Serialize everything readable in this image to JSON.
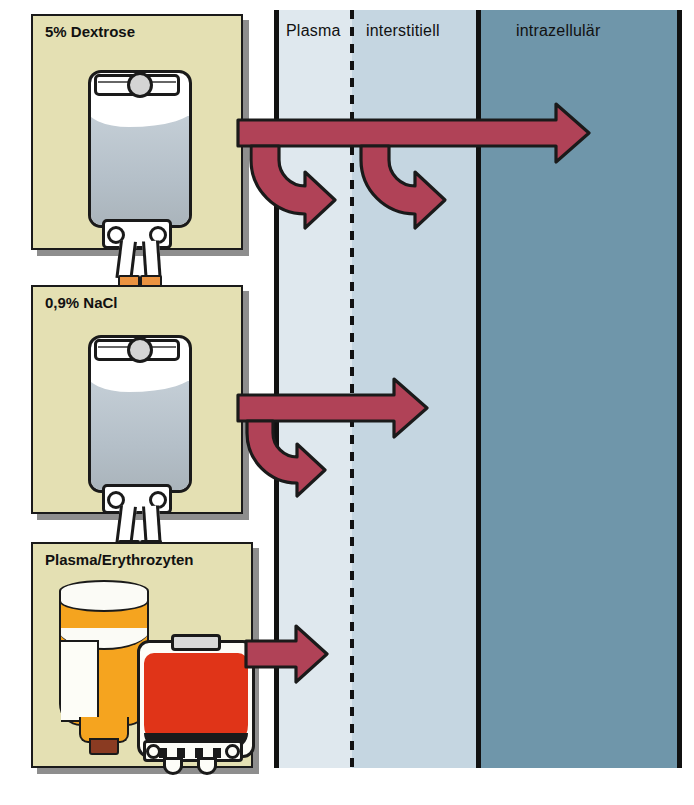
{
  "diagram": {
    "title_alt": "Verteilung von Infusionsloesungen in den Fluessigkeitskompartimenten",
    "compartments": [
      {
        "key": "plasma",
        "label": "Plasma",
        "color": "#dfe8ee"
      },
      {
        "key": "inter",
        "label": "interstitiell",
        "color": "#c5d6e1"
      },
      {
        "key": "intra",
        "label": "intrazellulär",
        "color": "#6f96aa"
      }
    ],
    "panels": [
      {
        "key": "dextrose",
        "title": "5% Dextrose",
        "container": "iv-bag"
      },
      {
        "key": "nacl",
        "title": "0,9% NaCl",
        "container": "iv-bag"
      },
      {
        "key": "blood",
        "title": "Plasma/Erythrozyten",
        "container": "bottle-and-blood-bag"
      }
    ],
    "flows": [
      {
        "from": "5% Dextrose",
        "reaches": [
          "Plasma",
          "interstitiell",
          "intrazellulär"
        ],
        "branches": 2
      },
      {
        "from": "0,9% NaCl",
        "reaches": [
          "Plasma",
          "interstitiell"
        ],
        "branches": 1
      },
      {
        "from": "Plasma/Erythrozyten",
        "reaches": [
          "Plasma"
        ],
        "branches": 0
      }
    ],
    "colors": {
      "panel_bg": "#e4e0b3",
      "panel_border": "#1a1a1a",
      "panel_shadow": "#8e8e8e",
      "arrow_fill": "#b04257",
      "arrow_stroke": "#1a1a1a",
      "dextrose_fluid": "#b9c4cd",
      "plasma_bottle": "#f5a41f",
      "erythrocytes": "#e03418",
      "bag_tip": "#eb9340",
      "divider": "#111111"
    }
  }
}
